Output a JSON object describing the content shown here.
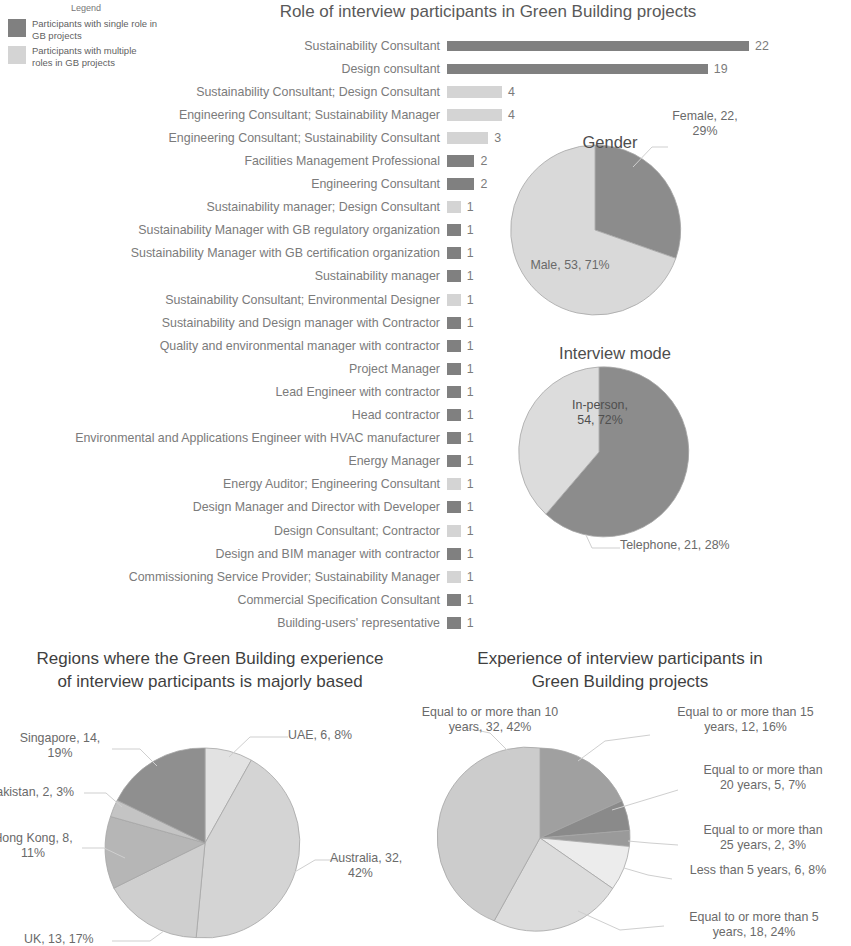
{
  "legend": {
    "title": "Legend",
    "items": [
      {
        "label": "Participants with single role in GB projects",
        "color": "#808080",
        "swatch_name": "legend-swatch-single"
      },
      {
        "label": "Participants with multiple roles in GB projects",
        "color": "#d4d4d4",
        "swatch_name": "legend-swatch-multiple"
      }
    ]
  },
  "chart_data": [
    {
      "id": "roles-bar",
      "type": "bar",
      "title": "Role of interview participants in Green Building projects",
      "orientation": "horizontal",
      "xlabel": "",
      "ylabel": "",
      "grid": false,
      "xlim": [
        0,
        22
      ],
      "series_colors": {
        "single": "#808080",
        "multiple": "#d4d4d4"
      },
      "categories": [
        "Sustainability Consultant",
        "Design consultant",
        "Sustainability Consultant; Design Consultant",
        "Engineering Consultant; Sustainability Manager",
        "Engineering Consultant; Sustainability Consultant",
        "Facilities Management Professional",
        "Engineering Consultant",
        "Sustainability manager; Design Consultant",
        "Sustainability Manager with GB regulatory organization",
        "Sustainability Manager with GB certification organization",
        "Sustainability manager",
        "Sustainability Consultant; Environmental Designer",
        "Sustainability and Design manager with Contractor",
        "Quality and environmental manager with contractor",
        "Project Manager",
        "Lead Engineer with contractor",
        "Head contractor",
        "Environmental and Applications Engineer with HVAC manufacturer",
        "Energy Manager",
        "Energy Auditor; Engineering Consultant",
        "Design Manager and Director with Developer",
        "Design Consultant; Contractor",
        "Design and BIM manager with contractor",
        "Commissioning Service Provider; Sustainability Manager",
        "Commercial Specification Consultant",
        "Building-users' representative"
      ],
      "values": [
        22,
        19,
        4,
        4,
        3,
        2,
        2,
        1,
        1,
        1,
        1,
        1,
        1,
        1,
        1,
        1,
        1,
        1,
        1,
        1,
        1,
        1,
        1,
        1,
        1,
        1
      ],
      "groups": [
        "single",
        "single",
        "multiple",
        "multiple",
        "multiple",
        "single",
        "single",
        "multiple",
        "single",
        "single",
        "single",
        "multiple",
        "single",
        "single",
        "single",
        "single",
        "single",
        "single",
        "single",
        "multiple",
        "single",
        "multiple",
        "single",
        "multiple",
        "single",
        "single"
      ]
    },
    {
      "id": "gender-pie",
      "type": "pie",
      "title": "Gender",
      "labels": [
        "Female",
        "Male"
      ],
      "values": [
        22,
        53
      ],
      "percents": [
        29,
        71
      ],
      "data_labels": [
        "Female, 22, 29%",
        "Male, 53, 71%"
      ],
      "colors": [
        "#8c8c8c",
        "#d9d9d9"
      ],
      "legend_position": "none"
    },
    {
      "id": "interview-mode-pie",
      "type": "pie",
      "title": "Interview mode",
      "labels": [
        "In-person",
        "Telephone"
      ],
      "values": [
        54,
        21
      ],
      "percents": [
        72,
        28
      ],
      "data_labels": [
        "In-person, 54, 72%",
        "Telephone, 21, 28%"
      ],
      "colors": [
        "#8c8c8c",
        "#dcdcdc"
      ],
      "legend_position": "none"
    },
    {
      "id": "regions-pie",
      "type": "pie",
      "title": "Regions where the Green Building experience of interview participants is majorly based",
      "labels": [
        "UAE",
        "Australia",
        "UK",
        "Hong Kong",
        "Pakistan",
        "Singapore"
      ],
      "values": [
        6,
        32,
        13,
        8,
        2,
        14
      ],
      "percents": [
        8,
        42,
        17,
        11,
        3,
        19
      ],
      "data_labels": [
        "UAE, 6, 8%",
        "Australia, 32, 42%",
        "UK, 13, 17%",
        "Hong Kong, 8, 11%",
        "Pakistan, 2, 3%",
        "Singapore, 14, 19%"
      ],
      "colors": [
        "#e2e2e2",
        "#d4d4d4",
        "#cfcfcf",
        "#b6b6b6",
        "#c4c4c4",
        "#8f8f8f"
      ],
      "legend_position": "none"
    },
    {
      "id": "experience-pie",
      "type": "pie",
      "title": "Experience of interview participants in Green Building projects",
      "labels": [
        "Equal to or more than 15 years",
        "Equal to or more than 20 years",
        "Equal to or more than 25 years",
        "Less than 5 years",
        "Equal to or more than 5 years",
        "Equal to or more than 10 years"
      ],
      "values": [
        12,
        5,
        2,
        6,
        18,
        32
      ],
      "percents": [
        16,
        7,
        3,
        8,
        24,
        42
      ],
      "data_labels": [
        "Equal to or more than 15 years, 12, 16%",
        "Equal to or more than 20 years, 5, 7%",
        "Equal to or more than 25 years, 2, 3%",
        "Less than 5 years, 6, 8%",
        "Equal to or more than 5 years, 18, 24%",
        "Equal to or more than 10 years, 32, 42%"
      ],
      "colors": [
        "#a0a0a0",
        "#8a8a8a",
        "#9a9a9a",
        "#ececec",
        "#dcdcdc",
        "#cccccc"
      ],
      "legend_position": "none"
    }
  ],
  "gender": {
    "title": "Gender",
    "female_label": "Female, 22,",
    "female_label_2": "29%",
    "male_label": "Male, 53, 71%"
  },
  "interview_mode": {
    "title": "Interview mode",
    "inperson_label": "In-person,",
    "inperson_label_2": "54, 72%",
    "telephone_label": "Telephone, 21, 28%"
  },
  "regions": {
    "title_line1": "Regions where the Green Building experience",
    "title_line2": "of interview participants is majorly based",
    "uae": "UAE, 6, 8%",
    "australia_1": "Australia, 32,",
    "australia_2": "42%",
    "uk": "UK, 13, 17%",
    "hongkong_1": "Hong Kong, 8,",
    "hongkong_2": "11%",
    "pakistan": "Pakistan, 2, 3%",
    "singapore_1": "Singapore, 14,",
    "singapore_2": "19%"
  },
  "experience": {
    "title_line1": "Experience of interview participants in",
    "title_line2": "Green Building projects",
    "y10_1": "Equal to or more than 10",
    "y10_2": "years, 32, 42%",
    "y15_1": "Equal to or more than 15",
    "y15_2": "years, 12, 16%",
    "y20_1": "Equal to or more than",
    "y20_2": "20 years, 5, 7%",
    "y25_1": "Equal to or more than",
    "y25_2": "25 years, 2, 3%",
    "lt5": "Less than 5 years, 6, 8%",
    "y5_1": "Equal to or more than 5",
    "y5_2": "years, 18, 24%"
  }
}
